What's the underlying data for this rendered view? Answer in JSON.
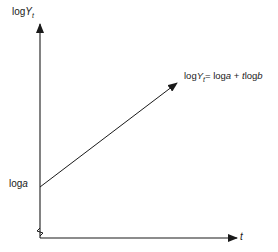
{
  "diagram": {
    "type": "semi-log growth line",
    "y_axis_label": {
      "prefix": "log",
      "var": "Y",
      "sub": "t"
    },
    "x_axis_label": "t",
    "intercept_label": {
      "prefix": "log",
      "var": "a"
    },
    "equation": {
      "lhs_prefix": "log",
      "lhs_var": "Y",
      "lhs_sub": "t",
      "rhs": "= log",
      "rhs_a": "a",
      "plus": " + ",
      "rhs_t": "t",
      "rhs_log": "log",
      "rhs_b": "b"
    },
    "line_color": "#1a1a1a",
    "axis_break": true
  }
}
